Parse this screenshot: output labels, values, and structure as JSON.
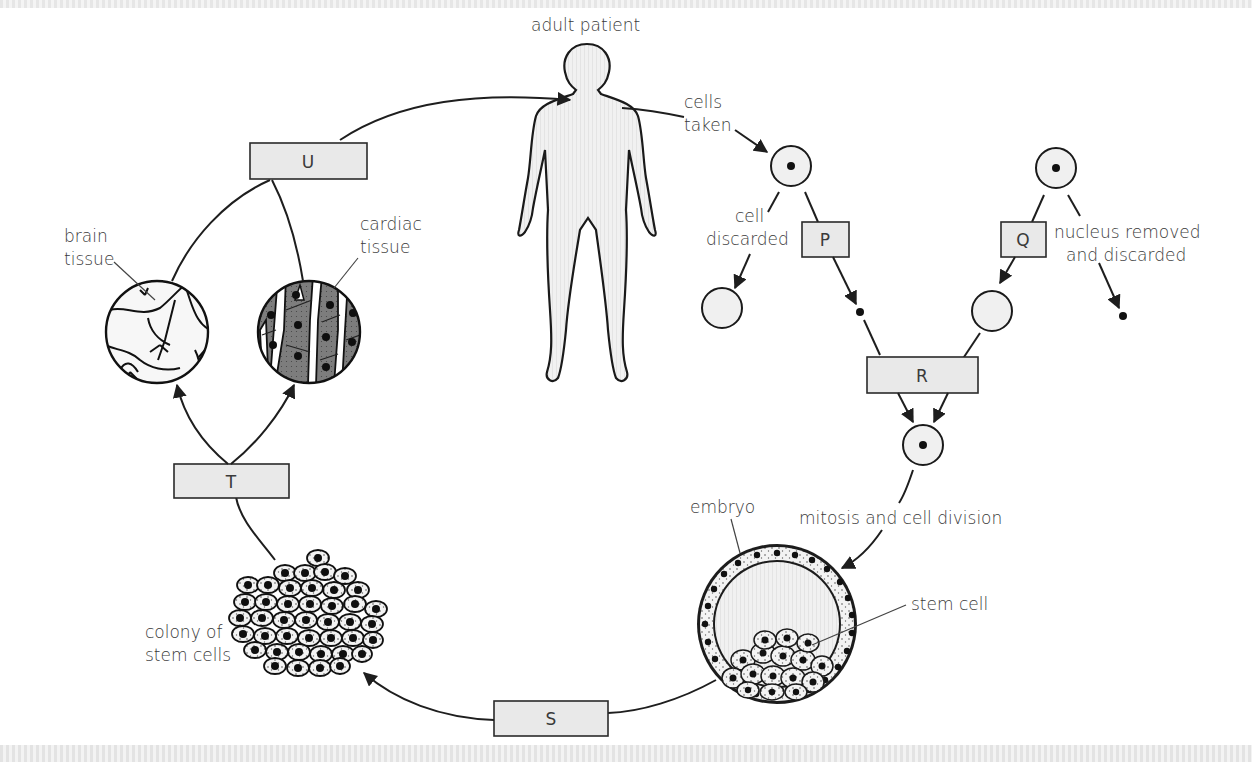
{
  "diagram": {
    "labels": {
      "adult_patient": "adult patient",
      "cells_taken_1": "cells",
      "cells_taken_2": "taken",
      "cell_discarded_1": "cell",
      "cell_discarded_2": "discarded",
      "nucleus_removed_1": "nucleus removed",
      "nucleus_removed_2": "and discarded",
      "mitosis": "mitosis and cell division",
      "embryo": "embryo",
      "stem_cell": "stem cell",
      "colony_1": "colony of",
      "colony_2": "stem cells",
      "brain_1": "brain",
      "brain_2": "tissue",
      "cardiac_1": "cardiac",
      "cardiac_2": "tissue"
    },
    "steps": [
      {
        "id": "P",
        "label": "P"
      },
      {
        "id": "Q",
        "label": "Q"
      },
      {
        "id": "R",
        "label": "R"
      },
      {
        "id": "S",
        "label": "S"
      },
      {
        "id": "T",
        "label": "T"
      },
      {
        "id": "U",
        "label": "U"
      }
    ],
    "colors": {
      "box_fill": "#e9e9e9",
      "outline": "#1e1e1e",
      "text": "#3a3a3a",
      "cardiac_fill": "#7a7a7a"
    }
  }
}
